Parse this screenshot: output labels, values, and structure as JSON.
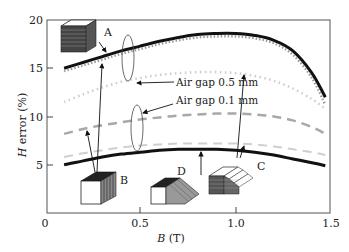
{
  "chart_data": {
    "type": "line",
    "title": "",
    "xlabel": "B (T)",
    "ylabel": "H error (%)",
    "xlim": [
      0,
      1.5
    ],
    "ylim": [
      0,
      20
    ],
    "xticks": [
      "0",
      "0.5",
      "1.0",
      "1.5"
    ],
    "yticks": [
      "5",
      "10",
      "15",
      "20"
    ],
    "grid": false,
    "legend": "none (annotations)",
    "x": [
      0.1,
      0.2,
      0.3,
      0.4,
      0.5,
      0.6,
      0.7,
      0.8,
      0.9,
      1.0,
      1.1,
      1.2,
      1.3,
      1.4,
      1.47
    ],
    "series": [
      {
        "name": "A (solid)",
        "style": "solid-black-thick",
        "values": [
          15.0,
          15.6,
          16.2,
          16.8,
          17.3,
          17.8,
          18.2,
          18.5,
          18.6,
          18.6,
          18.4,
          17.9,
          16.8,
          14.5,
          12.0
        ]
      },
      {
        "name": "A (air gap, dotted)",
        "style": "dotted-gray",
        "values": [
          14.7,
          15.3,
          15.9,
          16.5,
          17.0,
          17.5,
          17.9,
          18.2,
          18.3,
          18.3,
          18.1,
          17.6,
          16.4,
          14.0,
          11.2
        ]
      },
      {
        "name": "Air gap 0.5 mm (dotted light)",
        "style": "dotted-lightgray",
        "values": [
          11.5,
          12.3,
          13.0,
          13.6,
          14.0,
          14.3,
          14.5,
          14.6,
          14.6,
          14.5,
          14.2,
          13.7,
          12.9,
          11.8,
          10.8
        ]
      },
      {
        "name": "Air gap 0.1 mm (dashed)",
        "style": "dashed-gray",
        "values": [
          8.2,
          8.7,
          9.1,
          9.4,
          9.7,
          9.9,
          10.1,
          10.2,
          10.3,
          10.3,
          10.2,
          10.0,
          9.6,
          8.9,
          8.2
        ]
      },
      {
        "name": "B/D (dashed light)",
        "style": "dashed-lightgray",
        "values": [
          5.8,
          6.2,
          6.5,
          6.8,
          7.0,
          7.1,
          7.2,
          7.2,
          7.2,
          7.2,
          7.1,
          6.9,
          6.6,
          6.3,
          6.0
        ]
      },
      {
        "name": "B/C/D (solid)",
        "style": "solid-black-thick",
        "values": [
          5.0,
          5.4,
          5.8,
          6.1,
          6.3,
          6.5,
          6.6,
          6.6,
          6.6,
          6.5,
          6.3,
          6.0,
          5.6,
          5.2,
          4.9
        ]
      }
    ],
    "annotations": [
      "A",
      "B",
      "C",
      "D",
      "Air gap 0.5 mm",
      "Air gap 0.1 mm"
    ]
  },
  "labels": {
    "ylabel_italic": "H",
    "ylabel_rest": " error (%)",
    "xlabel_italic": "B",
    "xlabel_rest": " (T)",
    "x0": "0",
    "x05": "0.5",
    "x10": "1.0",
    "x15": "1.5",
    "y5": "5",
    "y10": "10",
    "y15": "15",
    "y20": "20",
    "A": "A",
    "B": "B",
    "C": "C",
    "D": "D",
    "gap05": "Air gap 0.5 mm",
    "gap01": "Air gap 0.1 mm"
  }
}
